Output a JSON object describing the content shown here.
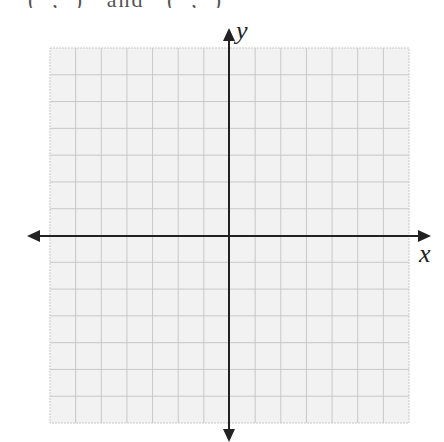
{
  "header": {
    "cropped_text": "(  ,  )   and   (  ,  )"
  },
  "plane": {
    "x_label": "x",
    "y_label": "y",
    "grid": {
      "left": 50,
      "top": 48,
      "right": 409,
      "bottom": 423,
      "cols": 14,
      "rows": 14
    },
    "colors": {
      "grid_fill": "#f2f2f2",
      "grid_line": "#c8c8c8",
      "axis": "#222222"
    }
  }
}
